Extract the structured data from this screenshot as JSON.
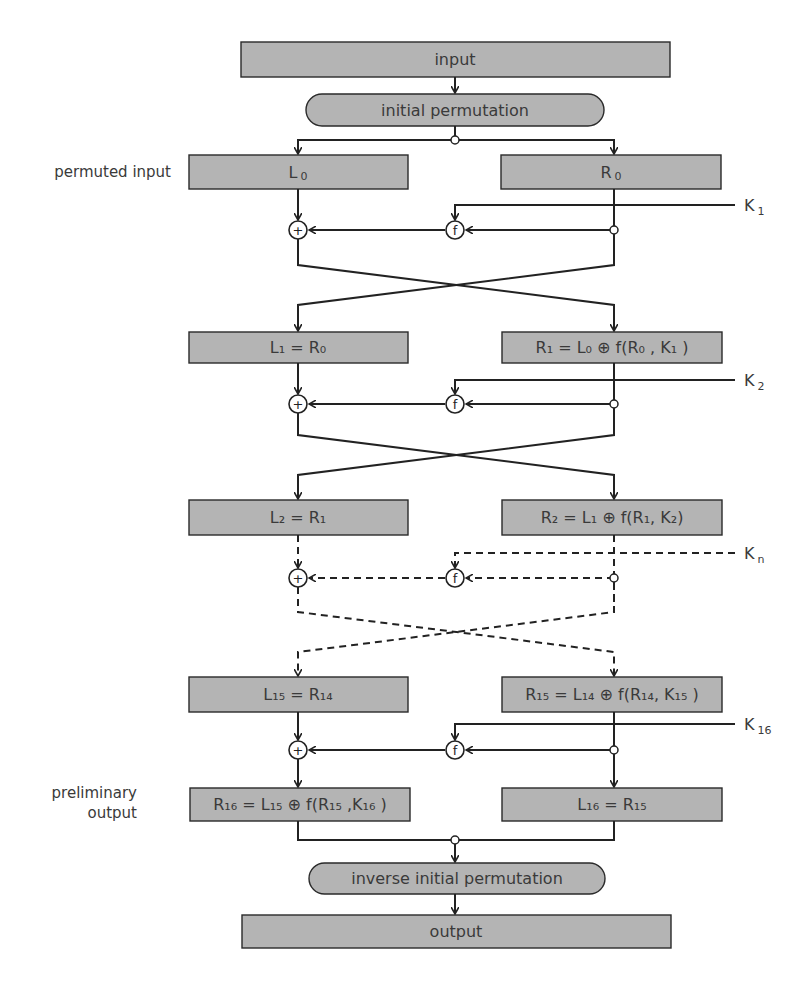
{
  "colors": {
    "box_fill": "#b4b4b4",
    "line": "#222222",
    "text": "#3a3a3a"
  },
  "top": {
    "input": "input",
    "initial_permutation": "initial permutation"
  },
  "side_labels": {
    "permuted_input": "permuted input",
    "preliminary_output_line1": "preliminary",
    "preliminary_output_line2": "output"
  },
  "rows": [
    {
      "left": {
        "main": "L",
        "sub": "0",
        "rest": ""
      },
      "right": {
        "main": "R",
        "sub": "0",
        "rest": ""
      }
    },
    {
      "left": {
        "text": "L₁ = R₀"
      },
      "right": {
        "text": "R₁ = L₀ ⊕ f(R₀ , K₁ )"
      }
    },
    {
      "left": {
        "text": "L₂ = R₁"
      },
      "right": {
        "text": "R₂ = L₁ ⊕ f(R₁, K₂)"
      }
    },
    {
      "left": {
        "text": "L₁₅ = R₁₄"
      },
      "right": {
        "text": "R₁₅ = L₁₄ ⊕ f(R₁₄, K₁₅ )"
      }
    },
    {
      "left": {
        "text": "R₁₆ = L₁₅ ⊕ f(R₁₅ ,K₁₆ )"
      },
      "right": {
        "text": "L₁₆ = R₁₅"
      }
    }
  ],
  "keys": [
    {
      "main": "K",
      "sub": "1"
    },
    {
      "main": "K",
      "sub": "2"
    },
    {
      "main": "K",
      "sub": "n"
    },
    {
      "main": "K",
      "sub": "16"
    }
  ],
  "nodes": {
    "xor": "+",
    "f": "f"
  },
  "bottom": {
    "inverse_initial_permutation": "inverse initial permutation",
    "output": "output"
  }
}
